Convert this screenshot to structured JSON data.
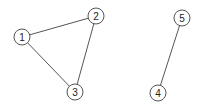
{
  "graph": {
    "nodes": [
      {
        "id": "1",
        "label": "1",
        "x": 22,
        "y": 37
      },
      {
        "id": "2",
        "label": "2",
        "x": 96,
        "y": 16
      },
      {
        "id": "3",
        "label": "3",
        "x": 75,
        "y": 92
      },
      {
        "id": "4",
        "label": "4",
        "x": 158,
        "y": 93
      },
      {
        "id": "5",
        "label": "5",
        "x": 182,
        "y": 18
      }
    ],
    "edges": [
      {
        "from": "1",
        "to": "2"
      },
      {
        "from": "2",
        "to": "3"
      },
      {
        "from": "1",
        "to": "3"
      },
      {
        "from": "5",
        "to": "4"
      }
    ],
    "node_radius": 8,
    "colors": {
      "stroke": "#555555",
      "fill": "#ffffff",
      "text": "#222222"
    }
  }
}
